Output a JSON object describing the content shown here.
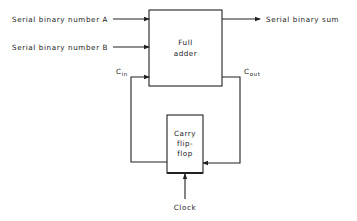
{
  "diagram": {
    "inputs": {
      "a_label": "Serial binary number  A",
      "b_label": "Serial binary number  B"
    },
    "output": {
      "sum_label": "Serial binary sum"
    },
    "full_adder": {
      "line1": "Full",
      "line2": "adder"
    },
    "carry_in": {
      "main": "C",
      "sub": "in"
    },
    "carry_out": {
      "main": "C",
      "sub": "out"
    },
    "flip_flop": {
      "line1": "Carry",
      "line2": "flip-",
      "line3": "flop"
    },
    "clock_label": "Clock",
    "colors": {
      "line": "#222222",
      "background": "#ffffff"
    }
  }
}
